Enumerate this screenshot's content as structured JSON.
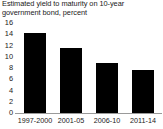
{
  "chart_data": {
    "type": "bar",
    "title": "Estimated yield to maturity on 10-year government bond, percent",
    "title_lines": [
      "Estimated yield to maturity on 10-year",
      "government bond, percent"
    ],
    "categories": [
      "1997-2000",
      "2001-05",
      "2006-10",
      "2011-14"
    ],
    "values": [
      14.2,
      11.6,
      8.9,
      7.6
    ],
    "xlabel": "",
    "ylabel": "",
    "ylim": [
      0,
      16
    ],
    "ytick_values": [
      0,
      2,
      4,
      6,
      8,
      10,
      12,
      14,
      16
    ],
    "ytick_labels": [
      "0",
      "2",
      "4",
      "6",
      "8",
      "10",
      "12",
      "14",
      "16"
    ],
    "grid": false,
    "legend": null,
    "bar_color": "#000000",
    "axis_color": "#9a9a9a",
    "text_color": "#1a1a1a",
    "background": "#ffffff"
  }
}
